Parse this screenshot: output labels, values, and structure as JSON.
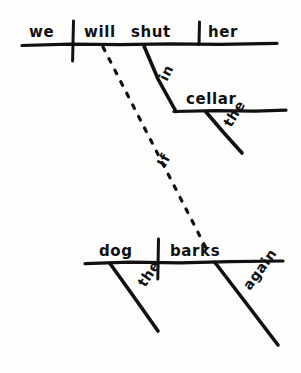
{
  "page": {
    "kind": "reed-kellogg-sentence-diagram",
    "background_color": "#fdfdfc",
    "ink_color": "#111111",
    "width": 301,
    "height": 373
  },
  "sentence": "If the dog barks again, we will shut her in the cellar.",
  "clauses": {
    "main": {
      "name": "main-clause",
      "baseline": {
        "x1": 22,
        "y1": 44,
        "x2": 277,
        "y2": 44
      },
      "words": {
        "subject": "we",
        "verb": "will shut",
        "direct_object": "her"
      },
      "dividers": [
        {
          "name": "subject-verb-divider",
          "x": 73,
          "y_top": 22,
          "y_bottom": 60
        },
        {
          "name": "verb-object-divider",
          "x": 199,
          "y_top": 22,
          "y_bottom": 44
        }
      ],
      "modifiers": [
        {
          "name": "prepositional-phrase-in",
          "preposition": "in",
          "object_of_preposition": "cellar",
          "article": "the"
        }
      ]
    },
    "subordinate": {
      "name": "subordinate-clause",
      "baseline": {
        "x1": 85,
        "y1": 262,
        "x2": 283,
        "y2": 262
      },
      "words": {
        "subject": "dog",
        "verb": "barks"
      },
      "dividers": [
        {
          "name": "subject-verb-divider",
          "x": 158,
          "y_top": 240,
          "y_bottom": 278
        }
      ],
      "modifiers": [
        {
          "name": "article-the",
          "label": "the"
        },
        {
          "name": "adverb-again",
          "label": "again"
        }
      ]
    }
  },
  "connector": {
    "name": "subordinating-conjunction",
    "label": "If",
    "style": "dotted",
    "from": {
      "x": 103,
      "y": 47
    },
    "to": {
      "x": 206,
      "y": 248
    },
    "label_position": {
      "x": 172,
      "y": 161
    },
    "label_rotation": -62
  },
  "labels": {
    "we": "we",
    "will": "will",
    "shut": "shut",
    "her": "her",
    "in": "in",
    "cellar": "cellar",
    "the_cellar_article": "the",
    "dog": "dog",
    "barks": "barks",
    "the_dog_article": "the",
    "again": "again",
    "if": "If"
  }
}
